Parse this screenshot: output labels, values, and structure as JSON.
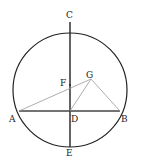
{
  "diagram": {
    "labels": {
      "A": "A",
      "B": "B",
      "C": "C",
      "D": "D",
      "E": "E",
      "F": "F",
      "G": "G"
    },
    "colors": {
      "circle": "#222222",
      "chord": "#333333",
      "thin": "#888888"
    }
  }
}
